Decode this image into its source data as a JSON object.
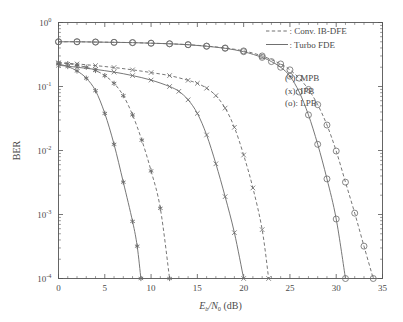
{
  "figure": {
    "background": "#ffffff",
    "axis_color": "#555555",
    "curve_color": "#707070",
    "marker_color": "#6a6a6a"
  },
  "axes": {
    "x": {
      "label_main": "E",
      "label_sub1": "b",
      "label_mid": "/N",
      "label_sub2": "0",
      "label_unit": " (dB)",
      "ticks": [
        "0",
        "5",
        "10",
        "15",
        "20",
        "25",
        "30",
        "35"
      ],
      "tick_values": [
        0,
        5,
        10,
        15,
        20,
        25,
        30,
        35
      ],
      "min": 0,
      "max": 35
    },
    "y": {
      "label": "BER",
      "ticks": [
        {
          "mantissa": "10",
          "exponent": "0",
          "value": 1
        },
        {
          "mantissa": "10",
          "exponent": "-1",
          "value": 0.1
        },
        {
          "mantissa": "10",
          "exponent": "-2",
          "value": 0.01
        },
        {
          "mantissa": "10",
          "exponent": "-3",
          "value": 0.001
        },
        {
          "mantissa": "10",
          "exponent": "-4",
          "value": 0.0001
        }
      ],
      "min": 0.0001,
      "max": 1
    }
  },
  "legend_lines": {
    "items": [
      {
        "style": "dashed",
        "label": ": Conv. IB-DFE"
      },
      {
        "style": "solid",
        "label": ": Turbo FDE"
      }
    ]
  },
  "legend_markers": {
    "items": [
      {
        "label": "(*): MPB"
      },
      {
        "label": "(x): IPB"
      },
      {
        "label": "(o): LPB"
      }
    ]
  },
  "chart_data": {
    "type": "line",
    "title": "",
    "xlabel": "Eb/N0 (dB)",
    "ylabel": "BER",
    "xlim": [
      0,
      35
    ],
    "ylim": [
      0.0001,
      1
    ],
    "yscale": "log",
    "grid": false,
    "legend_position": "top-right",
    "series": [
      {
        "name": "MPB Turbo FDE",
        "marker": "*",
        "style": "solid",
        "x": [
          0,
          1,
          2,
          3,
          4,
          5,
          6,
          7,
          8,
          8.5,
          8.9
        ],
        "values": [
          0.225,
          0.205,
          0.175,
          0.135,
          0.086,
          0.038,
          0.0125,
          0.0032,
          0.00078,
          0.00032,
          0.0001
        ]
      },
      {
        "name": "MPB Conv. IB-DFE",
        "marker": "*",
        "style": "dashed",
        "x": [
          0,
          1,
          2,
          3,
          4,
          5,
          6,
          7,
          8,
          9,
          10,
          11,
          12
        ],
        "values": [
          0.235,
          0.228,
          0.215,
          0.2,
          0.178,
          0.148,
          0.112,
          0.072,
          0.036,
          0.0145,
          0.0048,
          0.00125,
          0.0001
        ]
      },
      {
        "name": "IPB Turbo FDE",
        "marker": "x",
        "style": "solid",
        "x": [
          0,
          2,
          4,
          6,
          8,
          10,
          12,
          13,
          14,
          15,
          16,
          17,
          18,
          19,
          20
        ],
        "values": [
          0.215,
          0.2,
          0.185,
          0.168,
          0.148,
          0.126,
          0.1,
          0.084,
          0.062,
          0.038,
          0.0175,
          0.0062,
          0.0019,
          0.00052,
          0.0001
        ]
      },
      {
        "name": "IPB Conv. IB-DFE",
        "marker": "x",
        "style": "dashed",
        "x": [
          0,
          2,
          4,
          6,
          8,
          10,
          12,
          14,
          15,
          16,
          17,
          18,
          19,
          20,
          21,
          22,
          22.7
        ],
        "values": [
          0.235,
          0.225,
          0.212,
          0.198,
          0.182,
          0.165,
          0.148,
          0.125,
          0.112,
          0.094,
          0.072,
          0.046,
          0.023,
          0.0085,
          0.0026,
          0.00058,
          0.0001
        ]
      },
      {
        "name": "LPB Turbo FDE",
        "marker": "o",
        "style": "solid",
        "x": [
          0,
          2,
          4,
          6,
          8,
          10,
          12,
          14,
          16,
          18,
          20,
          22,
          23,
          24,
          25,
          26,
          27,
          28,
          29,
          30,
          31
        ],
        "values": [
          0.5,
          0.5,
          0.495,
          0.49,
          0.485,
          0.475,
          0.465,
          0.45,
          0.425,
          0.395,
          0.35,
          0.285,
          0.245,
          0.2,
          0.145,
          0.082,
          0.036,
          0.0125,
          0.0036,
          0.00085,
          0.0001
        ]
      },
      {
        "name": "LPB Conv. IB-DFE",
        "marker": "o",
        "style": "dashed",
        "x": [
          0,
          2,
          4,
          6,
          8,
          10,
          12,
          14,
          16,
          18,
          20,
          22,
          24,
          25,
          26,
          27,
          28,
          29,
          30,
          31,
          32,
          33,
          34
        ],
        "values": [
          0.5,
          0.5,
          0.495,
          0.49,
          0.485,
          0.475,
          0.465,
          0.45,
          0.428,
          0.4,
          0.36,
          0.3,
          0.225,
          0.182,
          0.135,
          0.09,
          0.052,
          0.025,
          0.0098,
          0.0032,
          0.00105,
          0.00032,
          0.0001
        ]
      }
    ]
  }
}
